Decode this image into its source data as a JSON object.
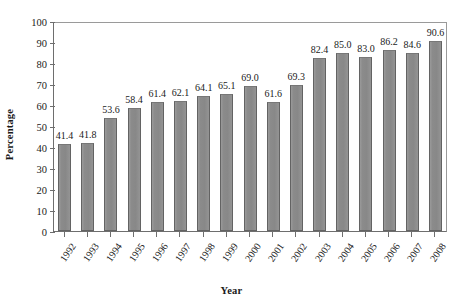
{
  "chart_data": {
    "type": "bar",
    "title": "",
    "subtitle": "",
    "xlabel": "Year",
    "ylabel": "Percentage",
    "categories": [
      "1992",
      "1993",
      "1994",
      "1995",
      "1996",
      "1997",
      "1998",
      "1999",
      "2000",
      "2001",
      "2002",
      "2003",
      "2004",
      "2005",
      "2006",
      "2007",
      "2008"
    ],
    "values": [
      41.4,
      41.8,
      53.6,
      58.4,
      61.4,
      62.1,
      64.1,
      65.1,
      69.0,
      61.6,
      69.3,
      82.4,
      85.0,
      83.0,
      86.2,
      84.6,
      90.6
    ],
    "value_labels": [
      "41.4",
      "41.8",
      "53.6",
      "58.4",
      "61.4",
      "62.1",
      "64.1",
      "65.1",
      "69.0",
      "61.6",
      "69.3",
      "82.4",
      "85.0",
      "83.0",
      "86.2",
      "84.6",
      "90.6"
    ],
    "ylim": [
      0,
      100
    ],
    "ytick_values": [
      0,
      10,
      20,
      30,
      40,
      50,
      60,
      70,
      80,
      90,
      100
    ],
    "ytick_labels": [
      "0",
      "10",
      "20",
      "30",
      "40",
      "50",
      "60",
      "70",
      "80",
      "90",
      "100"
    ],
    "grid": false,
    "legend": null,
    "legend_position": "none",
    "bar_color": "#8c8c8c",
    "bar_edge_color": "#636363",
    "axis_color": "#6e6e6e",
    "background_color": "#ffffff",
    "data_labels_shown": true,
    "xtick_label_rotation": -55
  }
}
